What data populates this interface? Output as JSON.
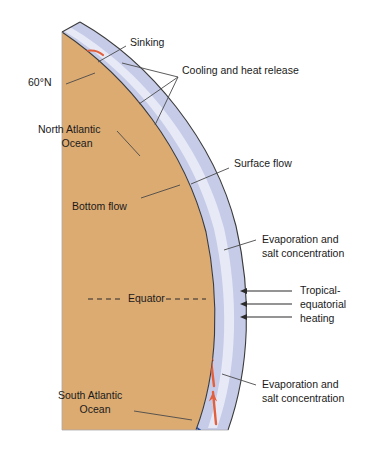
{
  "figure": {
    "type": "diagram",
    "colors": {
      "land": "#dcab72",
      "ocean_band": "#c6cbe8",
      "ocean_band_inner": "#eceef8",
      "surface_flow_arrow": "#e2603c",
      "bottom_flow_arrow": "#2b4fa2",
      "outline": "#3a3a3a",
      "leader_line": "#4a4a4a",
      "text": "#1a1a1a",
      "heating_arrow": "#2b2b2b",
      "background": "#ffffff"
    }
  },
  "labels": {
    "sinking": "Sinking",
    "cooling": "Cooling and heat release",
    "latitude_60n": "60°N",
    "north_atlantic_line1": "North Atlantic",
    "north_atlantic_line2": "Ocean",
    "surface_flow": "Surface flow",
    "bottom_flow": "Bottom flow",
    "evaporation_north_line1": "Evaporation and",
    "evaporation_north_line2": "salt concentration",
    "equator": "Equator",
    "tropical_line1": "Tropical-",
    "tropical_line2": "equatorial",
    "tropical_line3": "heating",
    "evaporation_south_line1": "Evaporation and",
    "evaporation_south_line2": "salt concentration",
    "south_atlantic_line1": "South Atlantic",
    "south_atlantic_line2": "Ocean"
  },
  "features": {
    "flows": [
      {
        "name": "surface-flow",
        "color": "#e2603c",
        "direction": "northward",
        "description": "Warm salty surface flow moving north toward the sinking region"
      },
      {
        "name": "bottom-flow",
        "color": "#2b4fa2",
        "direction": "southward",
        "description": "Cold deep bottom flow returning south"
      },
      {
        "name": "sinking-loop",
        "color": "#2b4fa2",
        "direction": "downwelling",
        "description": "Deep water formation loop at high latitude"
      }
    ],
    "heating_arrow_count": 3,
    "cooling_leader_count": 3
  }
}
